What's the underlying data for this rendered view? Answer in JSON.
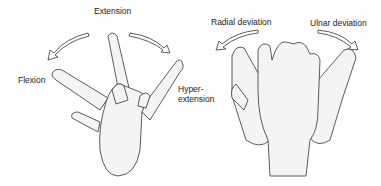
{
  "left_panel": {
    "labels": {
      "extension": "Extension",
      "flexion": "Flexion",
      "hyperextension_1": "Hyper-",
      "hyperextension_2": "extension"
    }
  },
  "right_panel": {
    "labels": {
      "radial_deviation": "Radial deviation",
      "ulnar_deviation": "Ulnar deviation"
    }
  },
  "colors": {
    "stroke": "#333333",
    "fill": "#f2f2f2"
  }
}
